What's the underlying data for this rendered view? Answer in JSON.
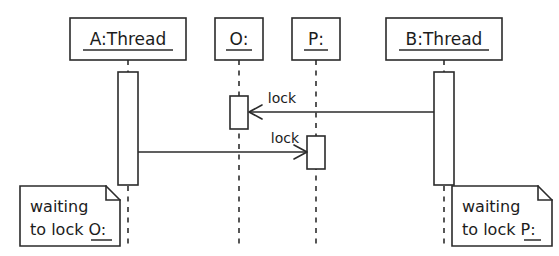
{
  "diagram": {
    "type": "uml-sequence-diagram",
    "background_color": "#ffffff",
    "stroke_color": "#2b2b2b",
    "lifelines": [
      {
        "id": "a-thread",
        "label": "A:Thread",
        "underlined": true,
        "x": 128,
        "head_box": {
          "x": 70,
          "y": 18,
          "width": 116,
          "height": 42
        },
        "activation": {
          "x": 118,
          "y": 72,
          "width": 20,
          "height": 113
        }
      },
      {
        "id": "o-object",
        "label": "O:",
        "underlined": true,
        "x": 239,
        "head_box": {
          "x": 215,
          "y": 18,
          "width": 48,
          "height": 42
        },
        "activation": {
          "x": 230,
          "y": 96,
          "width": 18,
          "height": 33
        }
      },
      {
        "id": "p-object",
        "label": "P:",
        "underlined": true,
        "x": 316,
        "head_box": {
          "x": 292,
          "y": 18,
          "width": 48,
          "height": 42
        },
        "activation": {
          "x": 307,
          "y": 136,
          "width": 18,
          "height": 33
        }
      },
      {
        "id": "b-thread",
        "label": "B:Thread",
        "underlined": true,
        "x": 444,
        "head_box": {
          "x": 386,
          "y": 18,
          "width": 116,
          "height": 42
        },
        "activation": {
          "x": 434,
          "y": 72,
          "width": 20,
          "height": 113
        }
      }
    ],
    "messages": [
      {
        "id": "msg-b-lock-o",
        "label": "lock",
        "from": "b-thread",
        "to": "o-object",
        "direction": "right-to-left",
        "y": 112,
        "x_start": 434,
        "x_end": 249,
        "arrowhead": "open",
        "label_x": 282,
        "label_y": 102
      },
      {
        "id": "msg-a-lock-p",
        "label": "lock",
        "from": "a-thread",
        "to": "p-object",
        "direction": "left-to-right",
        "y": 152,
        "x_start": 138,
        "x_end": 306,
        "arrowhead": "open",
        "label_x": 285,
        "label_y": 142
      }
    ],
    "notes": [
      {
        "id": "note-a-waiting",
        "attached_to": "a-thread",
        "line1": "waiting",
        "line2_prefix": "to lock ",
        "line2_target": "O:",
        "target_underlined": true,
        "box": {
          "x": 20,
          "y": 186,
          "width": 100,
          "height": 60
        },
        "fold_size": 14
      },
      {
        "id": "note-b-waiting",
        "attached_to": "b-thread",
        "line1": "waiting",
        "line2_prefix": "to lock ",
        "line2_target": "P:",
        "target_underlined": true,
        "box": {
          "x": 452,
          "y": 186,
          "width": 100,
          "height": 60
        },
        "fold_size": 14
      }
    ]
  }
}
